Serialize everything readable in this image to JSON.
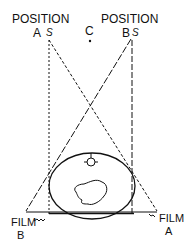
{
  "diagram": {
    "labels": {
      "position_a_title": "POSITION",
      "position_a_letter": "A",
      "position_b_title": "POSITION",
      "position_b_letter": "B",
      "source_symbol": "S",
      "center_letter": "C",
      "film_b_title": "FILM",
      "film_b_letter": "B",
      "film_a_title": "FILM",
      "film_a_letter": "A"
    },
    "colors": {
      "line": "#111111",
      "background": "#ffffff"
    }
  }
}
